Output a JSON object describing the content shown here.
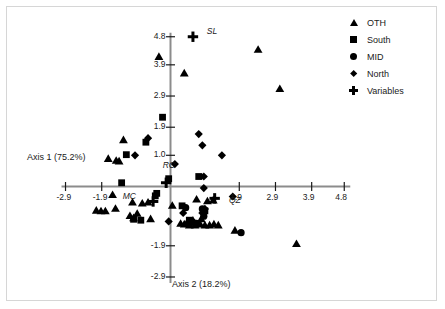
{
  "chart_data": {
    "type": "scatter",
    "title": "",
    "xlabel": "Axis 2 (18.2%)",
    "ylabel": "Axis 1 (75.2%)",
    "xlim": [
      -2.9,
      4.8
    ],
    "ylim": [
      -2.9,
      4.8
    ],
    "xticks": [
      "-2.9",
      "-1.9",
      "1.9",
      "2.9",
      "3.9",
      "4.8"
    ],
    "xtick_values": [
      -2.9,
      -1.9,
      1.9,
      2.9,
      3.9,
      4.8
    ],
    "yticks": [
      "4.8",
      "3.9",
      "2.9",
      "1.9",
      "1.0",
      "-1.9",
      "-2.9"
    ],
    "ytick_values": [
      4.8,
      3.9,
      2.9,
      1.9,
      1.0,
      -1.9,
      -2.9
    ],
    "grid": false,
    "legend_position": "top-right",
    "legend": [
      {
        "label": "OTH",
        "marker": "triangle"
      },
      {
        "label": "South",
        "marker": "square"
      },
      {
        "label": "MID",
        "marker": "circle"
      },
      {
        "label": "North",
        "marker": "diamond"
      },
      {
        "label": "Variables",
        "marker": "plus"
      }
    ],
    "annotations": [
      {
        "text": "SL",
        "x": 0.78,
        "y": 4.8
      },
      {
        "text": "RC",
        "x": -0.3,
        "y": 0.28
      },
      {
        "text": "MC",
        "x": -0.85,
        "y": -0.42
      },
      {
        "text": "QZ",
        "x": 1.42,
        "y": -0.38
      }
    ],
    "series": [
      {
        "name": "OTH",
        "marker": "triangle",
        "points": [
          [
            -0.32,
            4.15
          ],
          [
            0.38,
            3.62
          ],
          [
            2.42,
            4.38
          ],
          [
            3.02,
            3.12
          ],
          [
            -1.3,
            1.48
          ],
          [
            -1.72,
            0.88
          ],
          [
            -1.5,
            0.82
          ],
          [
            -1.42,
            0.8
          ],
          [
            -1.6,
            -0.28
          ],
          [
            -1.05,
            -0.52
          ],
          [
            -0.78,
            -0.55
          ],
          [
            -0.62,
            -0.52
          ],
          [
            -2.05,
            -0.78
          ],
          [
            -1.92,
            -0.8
          ],
          [
            -1.8,
            -0.8
          ],
          [
            -1.52,
            -0.72
          ],
          [
            -1.12,
            -0.95
          ],
          [
            -0.92,
            -0.88
          ],
          [
            -1.02,
            -1.02
          ],
          [
            -0.55,
            -1.05
          ],
          [
            0.05,
            -0.62
          ],
          [
            0.48,
            -1.12
          ],
          [
            0.62,
            -1.1
          ],
          [
            0.28,
            -1.2
          ],
          [
            0.38,
            -1.22
          ],
          [
            0.52,
            -1.25
          ],
          [
            0.68,
            -1.25
          ],
          [
            0.82,
            -1.22
          ],
          [
            0.95,
            -1.25
          ],
          [
            1.08,
            -1.25
          ],
          [
            1.2,
            -1.22
          ],
          [
            1.32,
            -1.25
          ],
          [
            0.72,
            -0.42
          ],
          [
            1.02,
            -0.48
          ],
          [
            1.18,
            -0.45
          ],
          [
            0.85,
            -1.05
          ],
          [
            1.78,
            -1.42
          ],
          [
            3.48,
            -1.85
          ]
        ]
      },
      {
        "name": "South",
        "marker": "square",
        "points": [
          [
            -0.22,
            2.22
          ],
          [
            -0.68,
            1.42
          ],
          [
            -1.22,
            1.02
          ],
          [
            -1.35,
            0.12
          ],
          [
            -0.05,
            0.25
          ],
          [
            -1.02,
            -1.05
          ],
          [
            -0.82,
            -1.08
          ],
          [
            0.32,
            -0.62
          ],
          [
            0.78,
            0.32
          ],
          [
            0.95,
            -0.78
          ],
          [
            0.52,
            -1.08
          ],
          [
            -0.42,
            -0.3
          ],
          [
            -0.38,
            -0.22
          ]
        ]
      },
      {
        "name": "MID",
        "marker": "circle",
        "points": [
          [
            0.42,
            -0.68
          ],
          [
            0.88,
            -0.72
          ],
          [
            0.62,
            -1.15
          ],
          [
            0.72,
            -1.18
          ],
          [
            0.92,
            -0.95
          ],
          [
            1.95,
            -1.48
          ],
          [
            0.52,
            -1.18
          ]
        ]
      },
      {
        "name": "North",
        "marker": "diamond",
        "points": [
          [
            -0.62,
            1.55
          ],
          [
            0.78,
            1.68
          ],
          [
            0.88,
            1.32
          ],
          [
            1.42,
            1.0
          ],
          [
            -0.98,
            1.0
          ],
          [
            0.12,
            0.72
          ],
          [
            0.92,
            0.32
          ],
          [
            0.92,
            -0.05
          ],
          [
            1.72,
            -0.32
          ],
          [
            0.35,
            -0.85
          ],
          [
            -0.05,
            -1.12
          ],
          [
            0.88,
            -0.85
          ],
          [
            0.95,
            -0.72
          ]
        ]
      },
      {
        "name": "Variables",
        "marker": "plus",
        "points": [
          [
            0.62,
            4.8
          ],
          [
            -0.12,
            0.12
          ],
          [
            -0.48,
            -0.48
          ],
          [
            1.22,
            -0.38
          ]
        ]
      }
    ]
  }
}
